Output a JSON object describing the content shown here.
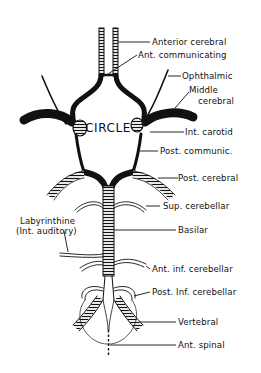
{
  "figure": {
    "center_label": "CIRCLE",
    "labels": [
      {
        "id": "anterior-cerebral",
        "text": "Anterior cerebral"
      },
      {
        "id": "ant-communicating",
        "text": "Ant. communicating"
      },
      {
        "id": "ophthalmic",
        "text": "Ophthalmic"
      },
      {
        "id": "middle-cerebral-1",
        "text": "Middle"
      },
      {
        "id": "middle-cerebral-2",
        "text": "cerebral"
      },
      {
        "id": "int-carotid",
        "text": "Int. carotid"
      },
      {
        "id": "post-communic",
        "text": "Post. communic."
      },
      {
        "id": "post-cerebral",
        "text": "Post. cerebral"
      },
      {
        "id": "sup-cerebellar",
        "text": "Sup. cerebellar"
      },
      {
        "id": "labyrinthine-1",
        "text": "Labyrinthine"
      },
      {
        "id": "labyrinthine-2",
        "text": "(Int. auditory)"
      },
      {
        "id": "basilar",
        "text": "Basilar"
      },
      {
        "id": "ant-inf-cerebellar",
        "text": "Ant. inf. cerebellar"
      },
      {
        "id": "post-inf-cerebellar",
        "text": "Post. Inf. cerebellar"
      },
      {
        "id": "vertebral",
        "text": "Vertebral"
      },
      {
        "id": "ant-spinal",
        "text": "Ant. spinal"
      }
    ],
    "colors": {
      "ink": "#111111",
      "background": "#ffffff"
    }
  }
}
